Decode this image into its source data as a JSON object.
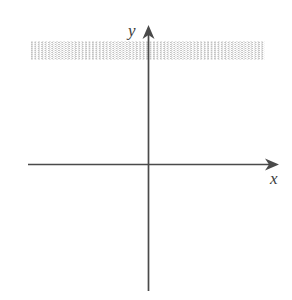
{
  "figure": {
    "kind": "blank-cartesian-coordinate-grid",
    "background_color": "#ffffff",
    "width": 292,
    "height": 300
  },
  "axes": {
    "x_axis": {
      "label": "x",
      "label_style": "italic-serif",
      "color": "#4a4a4a",
      "arrowhead": "right",
      "pixel_y": 164,
      "pixel_x_start": 28,
      "pixel_x_end": 277
    },
    "y_axis": {
      "label": "y",
      "label_style": "italic-serif",
      "color": "#4a4a4a",
      "arrowhead": "up",
      "pixel_x": 148,
      "pixel_y_start": 28,
      "pixel_y_end": 291
    },
    "origin": {
      "x": 148,
      "y": 164
    }
  },
  "grid": {
    "style": "dotted",
    "minor_color": "#e2e2e2",
    "major_color": "#c2c2c2",
    "minor_spacing_px": 13,
    "major_spacing_px": 26,
    "left": 31,
    "top": 41,
    "right": 265,
    "bottom": 285,
    "major_cols": 9,
    "major_rows": 9
  },
  "chart_data": {
    "type": "scatter",
    "title": "",
    "subtitle": "",
    "xlabel": "x",
    "ylabel": "y",
    "series": [
      {
        "name": "",
        "x": [],
        "y": []
      }
    ],
    "annotations": [],
    "legend": null,
    "legend_position": "none",
    "grid": true,
    "grid_style": "dotted",
    "xlim": [
      -4.5,
      4.5
    ],
    "ylim": [
      -4.7,
      4.7
    ],
    "xticks": [
      -4,
      -3,
      -2,
      -1,
      0,
      1,
      2,
      3,
      4
    ],
    "yticks": [
      -4,
      -3,
      -2,
      -1,
      0,
      1,
      2,
      3,
      4
    ],
    "xticklabels": [
      "",
      "",
      "",
      "",
      "",
      "",
      "",
      "",
      ""
    ],
    "yticklabels": [
      "",
      "",
      "",
      "",
      "",
      "",
      "",
      "",
      ""
    ],
    "minor_ticks_per_major": 2,
    "axis_arrows": [
      "x-positive",
      "y-positive"
    ],
    "note": "Empty grid template with no plotted data points"
  }
}
